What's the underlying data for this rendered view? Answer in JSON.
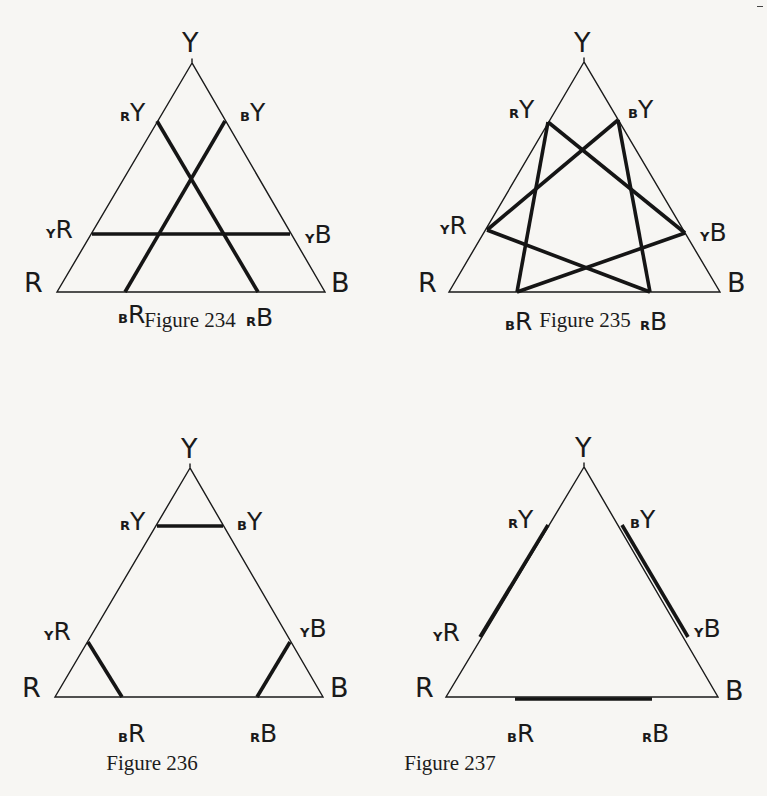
{
  "page": {
    "background": "#f7f6f3",
    "ink": "#1a1a1a"
  },
  "figures": [
    {
      "id": "fig234",
      "caption": "Figure 234",
      "caption_pos": [
        190,
        327
      ],
      "triangle": {
        "Y": [
          192,
          63
        ],
        "R": [
          57,
          292
        ],
        "B": [
          325,
          292
        ]
      },
      "points": {
        "rY": [
          157,
          121
        ],
        "bY": [
          225,
          121
        ],
        "yR": [
          92,
          234
        ],
        "yB": [
          290,
          234
        ],
        "bR": [
          125,
          292
        ],
        "rB": [
          258,
          292
        ]
      },
      "thick_lines": [
        [
          "rY",
          "rB"
        ],
        [
          "bY",
          "bR"
        ],
        [
          "yR",
          "yB"
        ]
      ],
      "labels": [
        {
          "key": "Y",
          "main": "Y",
          "sub": "",
          "pos": [
            182,
            52
          ]
        },
        {
          "key": "rY",
          "main": "Y",
          "sub": "R",
          "pos": [
            120,
            121
          ]
        },
        {
          "key": "bY",
          "main": "Y",
          "sub": "B",
          "pos": [
            240,
            121
          ]
        },
        {
          "key": "yR",
          "main": "R",
          "sub": "Y",
          "pos": [
            46,
            238
          ]
        },
        {
          "key": "yB",
          "main": "B",
          "sub": "Y",
          "pos": [
            305,
            243
          ]
        },
        {
          "key": "R",
          "main": "R",
          "sub": "",
          "pos": [
            24,
            292
          ]
        },
        {
          "key": "B",
          "main": "B",
          "sub": "",
          "pos": [
            331,
            292
          ]
        },
        {
          "key": "bR",
          "main": "R",
          "sub": "B",
          "pos": [
            118,
            323
          ]
        },
        {
          "key": "rB",
          "main": "B",
          "sub": "R",
          "pos": [
            246,
            326
          ]
        }
      ]
    },
    {
      "id": "fig235",
      "caption": "Figure 235",
      "caption_pos": [
        585,
        327
      ],
      "triangle": {
        "Y": [
          584,
          62
        ],
        "R": [
          449,
          292
        ],
        "B": [
          720,
          292
        ]
      },
      "points": {
        "rY": [
          548,
          122
        ],
        "bY": [
          618,
          120
        ],
        "yR": [
          487,
          230
        ],
        "yB": [
          685,
          233
        ],
        "bR": [
          517,
          292
        ],
        "rB": [
          650,
          292
        ]
      },
      "thick_lines": [
        [
          "rY",
          "bR"
        ],
        [
          "rY",
          "yB"
        ],
        [
          "bY",
          "yR"
        ],
        [
          "bY",
          "rB"
        ],
        [
          "yR",
          "rB"
        ],
        [
          "yB",
          "bR"
        ]
      ],
      "labels": [
        {
          "key": "Y",
          "main": "Y",
          "sub": "",
          "pos": [
            574,
            52
          ]
        },
        {
          "key": "rY",
          "main": "Y",
          "sub": "R",
          "pos": [
            509,
            118
          ]
        },
        {
          "key": "bY",
          "main": "Y",
          "sub": "B",
          "pos": [
            628,
            118
          ]
        },
        {
          "key": "yR",
          "main": "R",
          "sub": "Y",
          "pos": [
            440,
            234
          ]
        },
        {
          "key": "yB",
          "main": "B",
          "sub": "Y",
          "pos": [
            700,
            241
          ]
        },
        {
          "key": "R",
          "main": "R",
          "sub": "",
          "pos": [
            418,
            292
          ]
        },
        {
          "key": "B",
          "main": "B",
          "sub": "",
          "pos": [
            727,
            292
          ]
        },
        {
          "key": "bR",
          "main": "R",
          "sub": "B",
          "pos": [
            505,
            330
          ]
        },
        {
          "key": "rB",
          "main": "B",
          "sub": "R",
          "pos": [
            640,
            330
          ]
        }
      ]
    },
    {
      "id": "fig236",
      "caption": "Figure 236",
      "caption_pos": [
        152,
        770
      ],
      "triangle": {
        "Y": [
          190,
          468
        ],
        "R": [
          55,
          697
        ],
        "B": [
          323,
          697
        ]
      },
      "points": {
        "rY": [
          157,
          526
        ],
        "bY": [
          223,
          526
        ],
        "yR": [
          88,
          642
        ],
        "yB": [
          290,
          642
        ],
        "bR": [
          122,
          697
        ],
        "rB": [
          257,
          697
        ]
      },
      "thick_lines": [
        [
          "rY",
          "bY"
        ],
        [
          "yR",
          "bR"
        ],
        [
          "yB",
          "rB"
        ]
      ],
      "labels": [
        {
          "key": "Y",
          "main": "Y",
          "sub": "",
          "pos": [
            181,
            458
          ]
        },
        {
          "key": "rY",
          "main": "Y",
          "sub": "R",
          "pos": [
            120,
            530
          ]
        },
        {
          "key": "bY",
          "main": "Y",
          "sub": "B",
          "pos": [
            237,
            530
          ]
        },
        {
          "key": "yR",
          "main": "R",
          "sub": "Y",
          "pos": [
            44,
            640
          ]
        },
        {
          "key": "yB",
          "main": "B",
          "sub": "Y",
          "pos": [
            300,
            637
          ]
        },
        {
          "key": "R",
          "main": "R",
          "sub": "",
          "pos": [
            22,
            697
          ]
        },
        {
          "key": "B",
          "main": "B",
          "sub": "",
          "pos": [
            330,
            697
          ]
        },
        {
          "key": "bR",
          "main": "R",
          "sub": "B",
          "pos": [
            118,
            742
          ]
        },
        {
          "key": "rB",
          "main": "B",
          "sub": "R",
          "pos": [
            250,
            742
          ]
        }
      ]
    },
    {
      "id": "fig237",
      "caption": "Figure 237",
      "caption_pos": [
        450,
        770
      ],
      "triangle": {
        "Y": [
          584,
          467
        ],
        "R": [
          446,
          697
        ],
        "B": [
          718,
          697
        ]
      },
      "points": {
        "rY": [
          548,
          525
        ],
        "bY": [
          622,
          525
        ],
        "yR": [
          480,
          637
        ],
        "yB": [
          688,
          637
        ],
        "bR": [
          515,
          699
        ],
        "rB": [
          652,
          699
        ]
      },
      "thick_lines": [
        [
          "rY",
          "yR"
        ],
        [
          "bY",
          "yB"
        ],
        [
          "bR",
          "rB"
        ]
      ],
      "labels": [
        {
          "key": "Y",
          "main": "Y",
          "sub": "",
          "pos": [
            575,
            457
          ]
        },
        {
          "key": "rY",
          "main": "Y",
          "sub": "R",
          "pos": [
            508,
            528
          ]
        },
        {
          "key": "bY",
          "main": "Y",
          "sub": "B",
          "pos": [
            630,
            528
          ]
        },
        {
          "key": "yR",
          "main": "R",
          "sub": "Y",
          "pos": [
            433,
            641
          ]
        },
        {
          "key": "yB",
          "main": "B",
          "sub": "Y",
          "pos": [
            694,
            637
          ]
        },
        {
          "key": "R",
          "main": "R",
          "sub": "",
          "pos": [
            415,
            697
          ]
        },
        {
          "key": "B",
          "main": "B",
          "sub": "",
          "pos": [
            725,
            700
          ]
        },
        {
          "key": "bR",
          "main": "R",
          "sub": "B",
          "pos": [
            507,
            742
          ]
        },
        {
          "key": "rB",
          "main": "B",
          "sub": "R",
          "pos": [
            642,
            742
          ]
        }
      ]
    }
  ]
}
